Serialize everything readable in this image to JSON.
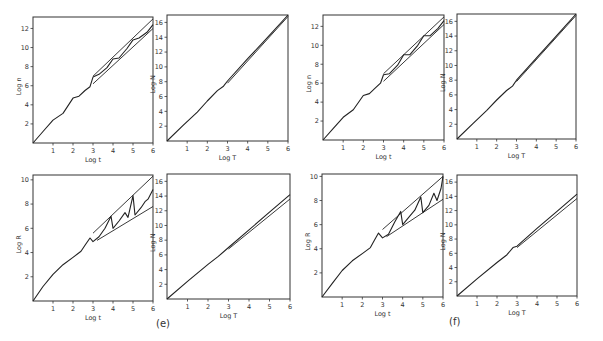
{
  "figure_labels": {
    "e": "(e)",
    "f": "(f)"
  },
  "chart_data": [
    {
      "id": "e-top-left",
      "type": "line",
      "xlabel": "Log t",
      "ylabel": "Log n",
      "xlim": [
        0,
        6
      ],
      "ylim": [
        0,
        13.2
      ],
      "xticks": [
        1,
        2,
        3,
        4,
        5,
        6
      ],
      "yticks": [
        2,
        4,
        6,
        8,
        10,
        12
      ],
      "grid": false,
      "box": {
        "left": 33,
        "top": 17,
        "width": 120,
        "height": 126
      },
      "series": [
        {
          "name": "n(t)",
          "x": [
            0,
            0.5,
            1.0,
            1.5,
            2.0,
            2.3,
            2.6,
            2.85,
            3.0,
            3.3,
            3.7,
            4.0,
            4.3,
            4.7,
            5.0,
            5.3,
            5.7,
            6.0
          ],
          "y": [
            0,
            1.2,
            2.4,
            3.1,
            4.7,
            4.9,
            5.5,
            5.9,
            6.9,
            7.2,
            7.9,
            8.8,
            8.9,
            9.9,
            10.8,
            11.0,
            11.6,
            12.4
          ]
        },
        {
          "name": "upper bound",
          "x": [
            3,
            6
          ],
          "y": [
            7.0,
            13.0
          ],
          "style": "envelope"
        },
        {
          "name": "lower bound",
          "x": [
            3,
            6
          ],
          "y": [
            6.2,
            12.0
          ],
          "style": "envelope"
        }
      ]
    },
    {
      "id": "e-top-right",
      "type": "line",
      "xlabel": "Log T",
      "ylabel": "Log N",
      "xlim": [
        0,
        6
      ],
      "ylim": [
        0,
        17
      ],
      "xticks": [
        1,
        2,
        3,
        4,
        5,
        6
      ],
      "yticks": [
        2,
        4,
        6,
        8,
        10,
        12,
        14,
        16
      ],
      "grid": false,
      "box": {
        "left": 167,
        "top": 15,
        "width": 121,
        "height": 126
      },
      "series": [
        {
          "name": "N(T)",
          "x": [
            0,
            0.8,
            1.5,
            2.0,
            2.5,
            2.8,
            3.0,
            4.0,
            5.0,
            6.0
          ],
          "y": [
            0,
            2.1,
            3.9,
            5.4,
            6.8,
            7.4,
            8.1,
            11.1,
            14.0,
            17.0
          ]
        },
        {
          "name": "N(T) band",
          "x": [
            3,
            6
          ],
          "y": [
            7.8,
            16.8
          ],
          "style": "envelope"
        }
      ]
    },
    {
      "id": "e-bottom-left",
      "type": "line",
      "xlabel": "Log t",
      "ylabel": "Log R",
      "xlim": [
        0,
        6
      ],
      "ylim": [
        0,
        10.4
      ],
      "xticks": [
        1,
        2,
        3,
        4,
        5,
        6
      ],
      "yticks": [
        2,
        4,
        6,
        8,
        10
      ],
      "grid": false,
      "box": {
        "left": 33,
        "top": 175,
        "width": 120,
        "height": 126
      },
      "series": [
        {
          "name": "R(t)",
          "x": [
            0,
            0.5,
            1.0,
            1.5,
            2.0,
            2.4,
            2.6,
            2.85,
            3.0,
            3.3,
            3.6,
            3.9,
            4.0,
            4.3,
            4.6,
            4.75,
            5.0,
            5.1,
            5.4,
            5.6,
            5.75,
            6.0
          ],
          "y": [
            0,
            1.2,
            2.2,
            3.0,
            3.6,
            4.1,
            4.6,
            5.2,
            4.9,
            5.3,
            6.0,
            7.0,
            6.0,
            6.6,
            7.3,
            6.9,
            8.7,
            7.1,
            7.7,
            8.2,
            8.4,
            9.2
          ]
        },
        {
          "name": "upper bound",
          "x": [
            3,
            6
          ],
          "y": [
            5.6,
            10.3
          ],
          "style": "envelope"
        },
        {
          "name": "lower bound",
          "x": [
            3.2,
            6
          ],
          "y": [
            5.0,
            7.8
          ],
          "style": "envelope"
        }
      ]
    },
    {
      "id": "e-bottom-right",
      "type": "line",
      "xlabel": "Log T",
      "ylabel": "Log N",
      "xlim": [
        0,
        6
      ],
      "ylim": [
        0,
        17
      ],
      "xticks": [
        1,
        2,
        3,
        4,
        5,
        6
      ],
      "yticks": [
        2,
        4,
        6,
        8,
        10,
        12,
        14,
        16
      ],
      "grid": false,
      "box": {
        "left": 167,
        "top": 174,
        "width": 123,
        "height": 125
      },
      "series": [
        {
          "name": "N(T)",
          "x": [
            0,
            1,
            2,
            2.5,
            3.0,
            4.0,
            5.0,
            6.0
          ],
          "y": [
            0,
            2.4,
            4.7,
            5.8,
            7.0,
            9.4,
            11.8,
            14.2
          ]
        },
        {
          "name": "N(T) band",
          "x": [
            3,
            6
          ],
          "y": [
            6.8,
            13.6
          ],
          "style": "envelope"
        }
      ]
    },
    {
      "id": "f-top-left",
      "type": "line",
      "xlabel": "Log t",
      "ylabel": "Log n",
      "xlim": [
        0,
        6
      ],
      "ylim": [
        0,
        13.2
      ],
      "xticks": [
        1,
        2,
        3,
        4,
        5,
        6
      ],
      "yticks": [
        2,
        4,
        6,
        8,
        10,
        12
      ],
      "grid": false,
      "box": {
        "left": 323,
        "top": 15,
        "width": 121,
        "height": 125
      },
      "series": [
        {
          "name": "n(t)",
          "x": [
            0,
            0.5,
            1.0,
            1.5,
            2.0,
            2.3,
            2.6,
            2.85,
            3.0,
            3.3,
            3.7,
            4.0,
            4.3,
            4.7,
            5.0,
            5.3,
            5.7,
            6.0
          ],
          "y": [
            0,
            1.2,
            2.4,
            3.2,
            4.7,
            4.9,
            5.5,
            6.0,
            6.9,
            7.0,
            7.9,
            9.0,
            9.0,
            10.0,
            11.0,
            11.0,
            11.8,
            12.6
          ]
        },
        {
          "name": "upper bound",
          "x": [
            3,
            6
          ],
          "y": [
            7.0,
            13.0
          ],
          "style": "envelope"
        },
        {
          "name": "lower bound",
          "x": [
            3,
            6
          ],
          "y": [
            6.2,
            12.2
          ],
          "style": "envelope"
        }
      ]
    },
    {
      "id": "f-top-right",
      "type": "line",
      "xlabel": "Log T",
      "ylabel": "Log N",
      "xlim": [
        0,
        6
      ],
      "ylim": [
        0,
        17
      ],
      "xticks": [
        1,
        2,
        3,
        4,
        5,
        6
      ],
      "yticks": [
        2,
        4,
        6,
        8,
        10,
        12,
        14,
        16
      ],
      "grid": false,
      "box": {
        "left": 457,
        "top": 14,
        "width": 119,
        "height": 125
      },
      "series": [
        {
          "name": "N(T)",
          "x": [
            0,
            0.8,
            1.5,
            2.0,
            2.5,
            2.8,
            3.0,
            4.0,
            5.0,
            6.0
          ],
          "y": [
            0,
            2.1,
            3.9,
            5.3,
            6.6,
            7.2,
            8.0,
            11.0,
            14.0,
            17.0
          ]
        },
        {
          "name": "N(T) band",
          "x": [
            3,
            6
          ],
          "y": [
            7.8,
            16.8
          ],
          "style": "envelope"
        }
      ]
    },
    {
      "id": "f-bottom-left",
      "type": "line",
      "xlabel": "Log t",
      "ylabel": "Log R",
      "xlim": [
        0,
        6
      ],
      "ylim": [
        0,
        10.2
      ],
      "xticks": [
        1,
        2,
        3,
        4,
        5,
        6
      ],
      "yticks": [
        2,
        4,
        6,
        8,
        10
      ],
      "grid": false,
      "box": {
        "left": 322,
        "top": 174,
        "width": 121,
        "height": 123
      },
      "series": [
        {
          "name": "R(t)",
          "x": [
            0,
            0.5,
            1.0,
            1.5,
            2.0,
            2.4,
            2.6,
            2.8,
            3.0,
            3.3,
            3.6,
            3.9,
            4.0,
            4.3,
            4.6,
            4.9,
            5.0,
            5.3,
            5.55,
            5.7,
            5.9,
            6.0
          ],
          "y": [
            0,
            1.1,
            2.2,
            3.0,
            3.6,
            4.1,
            4.7,
            5.3,
            4.9,
            5.2,
            6.2,
            7.1,
            6.0,
            6.6,
            7.2,
            8.3,
            7.0,
            7.6,
            8.6,
            8.0,
            9.0,
            10.0
          ]
        },
        {
          "name": "upper bound",
          "x": [
            3,
            6
          ],
          "y": [
            5.6,
            10.0
          ],
          "style": "envelope"
        },
        {
          "name": "lower bound",
          "x": [
            3.2,
            6
          ],
          "y": [
            5.0,
            8.1
          ],
          "style": "envelope"
        }
      ]
    },
    {
      "id": "f-bottom-right",
      "type": "line",
      "xlabel": "Log T",
      "ylabel": "Log N",
      "xlim": [
        0,
        6
      ],
      "ylim": [
        0,
        17
      ],
      "xticks": [
        1,
        2,
        3,
        4,
        5,
        6
      ],
      "yticks": [
        2,
        4,
        6,
        8,
        10,
        12,
        14,
        16
      ],
      "grid": false,
      "box": {
        "left": 457,
        "top": 175,
        "width": 120,
        "height": 121
      },
      "series": [
        {
          "name": "N(T)",
          "x": [
            0,
            1,
            2,
            2.5,
            2.8,
            3.0,
            4.0,
            5.0,
            6.0
          ],
          "y": [
            0,
            2.4,
            4.7,
            5.8,
            6.8,
            7.0,
            9.5,
            11.9,
            14.3
          ]
        },
        {
          "name": "N(T) band",
          "x": [
            3,
            6
          ],
          "y": [
            6.8,
            13.7
          ],
          "style": "envelope"
        }
      ]
    }
  ]
}
